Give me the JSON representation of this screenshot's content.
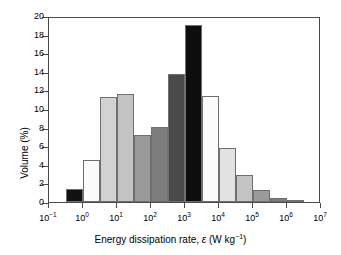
{
  "chart_data": {
    "type": "bar",
    "title": "",
    "xlabel": "Energy dissipation rate, ε (W kg⁻¹)",
    "ylabel": "Volume (%)",
    "xscale": "log",
    "xlim": [
      -1,
      7
    ],
    "ylim": [
      0,
      20
    ],
    "grid": false,
    "legend": "none",
    "bin_width_decades": 0.5,
    "ytick_labels": [
      "0",
      "2",
      "4",
      "6",
      "8",
      "10",
      "12",
      "14",
      "16",
      "18",
      "20"
    ],
    "ytick_values": [
      0,
      2,
      4,
      6,
      8,
      10,
      12,
      14,
      16,
      18,
      20
    ],
    "xtick_labels": [
      "10⁻¹",
      "10⁰",
      "10¹",
      "10²",
      "10³",
      "10⁴",
      "10⁵",
      "10⁶",
      "10⁷"
    ],
    "xtick_exponents": [
      -1,
      0,
      1,
      2,
      3,
      4,
      5,
      6,
      7
    ],
    "categories": [
      "10^-0.5",
      "10^0",
      "10^0.5",
      "10^1",
      "10^1.5",
      "10^2",
      "10^2.5",
      "10^3",
      "10^3.5",
      "10^4",
      "10^4.5",
      "10^5",
      "10^5.5",
      "10^6"
    ],
    "bins": [
      {
        "x_start": -0.5,
        "x_end": 0.0,
        "value": 1.4,
        "color": "#111111"
      },
      {
        "x_start": 0.0,
        "x_end": 0.5,
        "value": 4.5,
        "color": "#fbfbfb"
      },
      {
        "x_start": 0.5,
        "x_end": 1.0,
        "value": 11.25,
        "color": "#d2d2d2"
      },
      {
        "x_start": 1.0,
        "x_end": 1.5,
        "value": 11.65,
        "color": "#c3c3c3"
      },
      {
        "x_start": 1.5,
        "x_end": 2.0,
        "value": 7.2,
        "color": "#9a9a9a"
      },
      {
        "x_start": 2.0,
        "x_end": 2.5,
        "value": 8.05,
        "color": "#7d7d7d"
      },
      {
        "x_start": 2.5,
        "x_end": 3.0,
        "value": 13.8,
        "color": "#4a4a4a"
      },
      {
        "x_start": 3.0,
        "x_end": 3.5,
        "value": 19.0,
        "color": "#0d0d0d"
      },
      {
        "x_start": 3.5,
        "x_end": 4.0,
        "value": 11.35,
        "color": "#fbfbfb"
      },
      {
        "x_start": 4.0,
        "x_end": 4.5,
        "value": 5.8,
        "color": "#e2e2e2"
      },
      {
        "x_start": 4.5,
        "x_end": 5.0,
        "value": 2.9,
        "color": "#c3c3c3"
      },
      {
        "x_start": 5.0,
        "x_end": 5.5,
        "value": 1.3,
        "color": "#9a9a9a"
      },
      {
        "x_start": 5.5,
        "x_end": 6.0,
        "value": 0.45,
        "color": "#7d7d7d"
      },
      {
        "x_start": 6.0,
        "x_end": 6.5,
        "value": 0.12,
        "color": "#111111"
      }
    ],
    "values": [
      1.4,
      4.5,
      11.25,
      11.65,
      7.2,
      8.05,
      13.8,
      19.0,
      11.35,
      5.8,
      2.9,
      1.3,
      0.45,
      0.12
    ]
  },
  "axis": {
    "x_title_prefix": "Energy dissipation rate, ",
    "x_title_symbol": "ε",
    "x_title_unit_open": " (W kg",
    "x_title_unit_sup": "−1",
    "x_title_unit_close": ")",
    "y_title": "Volume (%)"
  }
}
